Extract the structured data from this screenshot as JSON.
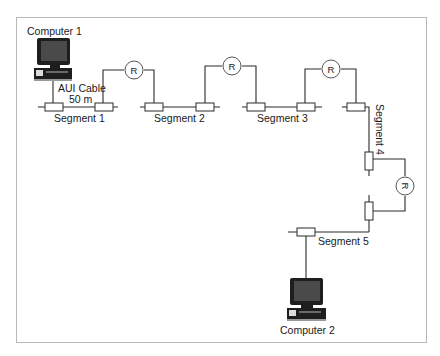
{
  "diagram": {
    "type": "network-topology",
    "frame": {
      "border_color": "#b8b8b8",
      "background": "#ffffff"
    },
    "nodes": [
      {
        "id": "computer1",
        "label": "Computer 1",
        "kind": "computer"
      },
      {
        "id": "computer2",
        "label": "Computer 2",
        "kind": "computer"
      },
      {
        "id": "r1",
        "label": "R",
        "kind": "repeater"
      },
      {
        "id": "r2",
        "label": "R",
        "kind": "repeater"
      },
      {
        "id": "r3",
        "label": "R",
        "kind": "repeater"
      },
      {
        "id": "r4",
        "label": "R",
        "kind": "repeater"
      }
    ],
    "segments": [
      {
        "id": "seg1",
        "label": "Segment 1"
      },
      {
        "id": "seg2",
        "label": "Segment 2"
      },
      {
        "id": "seg3",
        "label": "Segment 3"
      },
      {
        "id": "seg4",
        "label": "Segment 4"
      },
      {
        "id": "seg5",
        "label": "Segment 5"
      }
    ],
    "cable": {
      "label_line1": "AUI Cable",
      "label_line2": "50 m"
    },
    "edges": [
      {
        "from": "computer1",
        "to": "seg1",
        "via": "AUI Cable 50 m"
      },
      {
        "from": "seg1",
        "to": "seg2",
        "via": "r1"
      },
      {
        "from": "seg2",
        "to": "seg3",
        "via": "r2"
      },
      {
        "from": "seg3",
        "to": "seg4",
        "via": "r3"
      },
      {
        "from": "seg4",
        "to": "seg5",
        "via": "r4"
      },
      {
        "from": "seg5",
        "to": "computer2"
      }
    ]
  }
}
